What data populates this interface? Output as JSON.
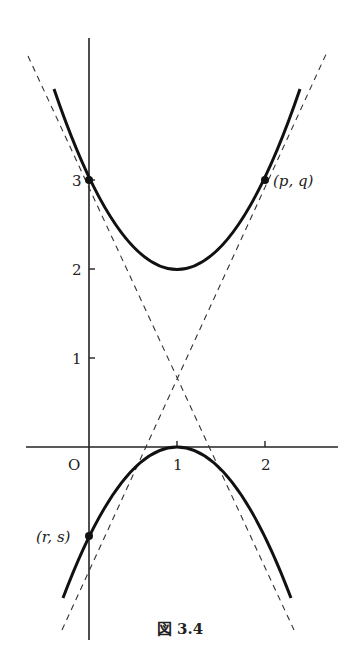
{
  "figure": {
    "caption": "図 3.4",
    "axes": {
      "origin_label": "O",
      "x_ticks": [
        "1",
        "2"
      ],
      "y_ticks": [
        "1",
        "2",
        "3"
      ]
    },
    "curves": [
      {
        "name": "upper-parabola",
        "equation": "y = (x-1)^2 + 2",
        "vertex": [
          1,
          2
        ],
        "style": "solid"
      },
      {
        "name": "lower-parabola",
        "equation": "y = -(x-1)^2",
        "vertex": [
          1,
          0
        ],
        "style": "solid"
      },
      {
        "name": "tangent-line-1",
        "equation": "y = -2x + 3",
        "style": "dashed"
      },
      {
        "name": "tangent-line-2",
        "equation": "y = 2x - 1",
        "style": "dashed"
      }
    ],
    "points": [
      {
        "label": "(p, q)",
        "x": 2,
        "y": 3
      },
      {
        "label": "(r, s)",
        "x": 0,
        "y": -1
      },
      {
        "label": "",
        "x": 0,
        "y": 3
      }
    ],
    "labels": {
      "pq": "(p, q)",
      "rs": "(r, s)"
    }
  }
}
